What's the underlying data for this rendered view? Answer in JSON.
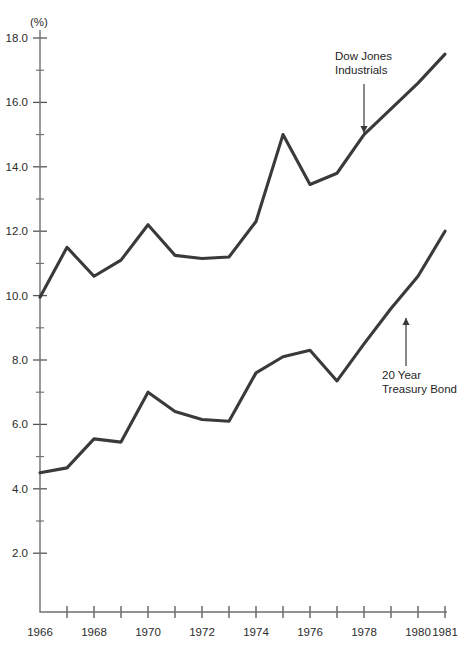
{
  "chart_data": {
    "type": "line",
    "title": "",
    "xlabel": "",
    "ylabel": "(%)",
    "unit_label": "(%)",
    "x": [
      1966,
      1967,
      1968,
      1969,
      1970,
      1971,
      1972,
      1973,
      1974,
      1975,
      1976,
      1977,
      1978,
      1979,
      1980,
      1981
    ],
    "xlim": [
      1966,
      1981
    ],
    "ylim": [
      0,
      18.0
    ],
    "grid": false,
    "legend_position": "inline-annotations",
    "y_ticks_major": [
      "2.0",
      "4.0",
      "6.0",
      "8.0",
      "10.0",
      "12.0",
      "14.0",
      "16.0",
      "18.0"
    ],
    "y_ticks_major_values": [
      2.0,
      4.0,
      6.0,
      8.0,
      10.0,
      12.0,
      14.0,
      16.0,
      18.0
    ],
    "y_ticks_minor_values": [
      3.0,
      5.0,
      7.0,
      9.0,
      11.0,
      13.0,
      15.0,
      17.0
    ],
    "x_tick_values": [
      1966,
      1967,
      1968,
      1969,
      1970,
      1971,
      1972,
      1973,
      1974,
      1975,
      1976,
      1977,
      1978,
      1979,
      1980,
      1981
    ],
    "x_tick_labels": [
      {
        "value": 1966,
        "label": "1966"
      },
      {
        "value": 1968,
        "label": "1968"
      },
      {
        "value": 1970,
        "label": "1970"
      },
      {
        "value": 1972,
        "label": "1972"
      },
      {
        "value": 1974,
        "label": "1974"
      },
      {
        "value": 1976,
        "label": "1976"
      },
      {
        "value": 1978,
        "label": "1978"
      },
      {
        "value": 1980,
        "label": "1980"
      },
      {
        "value": 1981,
        "label": "1981"
      }
    ],
    "series": [
      {
        "name": "Dow Jones Industrials",
        "color": "#3a3a3a",
        "values": [
          9.95,
          11.5,
          10.6,
          11.1,
          12.2,
          11.25,
          11.15,
          11.2,
          12.3,
          15.0,
          13.45,
          13.8,
          15.0,
          15.8,
          16.6,
          17.5
        ]
      },
      {
        "name": "20 Year Treasury Bond",
        "color": "#3a3a3a",
        "values": [
          4.5,
          4.65,
          5.55,
          5.45,
          7.0,
          6.4,
          6.15,
          6.1,
          7.6,
          8.1,
          8.3,
          7.35,
          8.5,
          9.6,
          10.6,
          12.0
        ]
      }
    ],
    "annotations": [
      {
        "id": "dow-jones-annotation",
        "line1": "Dow Jones",
        "line2": "Industrials",
        "text_x": 335,
        "text_y": 60,
        "arrow_x": 364,
        "arrow_from_y": 84,
        "arrow_to_y": 133,
        "direction": "down"
      },
      {
        "id": "treasury-bond-annotation",
        "line1": "20 Year",
        "line2": "Treasury Bond",
        "text_x": 382,
        "text_y": 379,
        "arrow_x": 406,
        "arrow_from_y": 366,
        "arrow_to_y": 318,
        "direction": "up"
      }
    ]
  },
  "geometry": {
    "axis_x": 40,
    "axis_top": 30,
    "axis_bottom": 612,
    "plot_right": 447,
    "y_value_top": 18.0,
    "y_pixel_top": 38,
    "px_per_unit": 32.2,
    "x_start_px": 40,
    "x_step_px": 27.0
  }
}
